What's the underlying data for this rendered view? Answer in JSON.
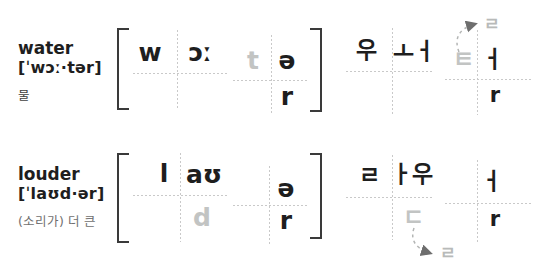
{
  "rows": [
    {
      "word": "water",
      "ipa": "[ˈwɔː·tər]",
      "meaning": "물",
      "phonetic": {
        "syllable1": {
          "onset": "w",
          "vowel": "ɔː"
        },
        "syllable2": {
          "onset": "t",
          "vowel": "ə",
          "coda": "r"
        }
      },
      "korean": {
        "syllable1": {
          "onset": "우",
          "vowel": "ㅗㅓ"
        },
        "syllable2": {
          "onset": "ㅌ",
          "vowel": "ㅓ",
          "coda": "r",
          "flap": "ㄹ"
        }
      }
    },
    {
      "word": "louder",
      "ipa": "[ˈlaʊd·ər]",
      "meaning": "(소리가) 더 큰",
      "phonetic": {
        "syllable1": {
          "onset": "l",
          "vowel": "aʊ",
          "coda": "d"
        },
        "syllable2": {
          "vowel": "ə",
          "coda": "r"
        }
      },
      "korean": {
        "syllable1": {
          "onset": "ㄹ",
          "vowel": "ㅏ우",
          "coda": "ㄷ",
          "flap": "ㄹ"
        },
        "syllable2": {
          "vowel": "ㅓ",
          "coda": "r"
        }
      }
    }
  ],
  "colors": {
    "text": "#1e1e1e",
    "muted_letter": "#c2c4c3",
    "flap_letter": "#b8bab9",
    "grid_line": "#c9c9c9",
    "bracket": "#3a3a3a",
    "arrow": "#6e6e6e",
    "background": "#ffffff"
  }
}
